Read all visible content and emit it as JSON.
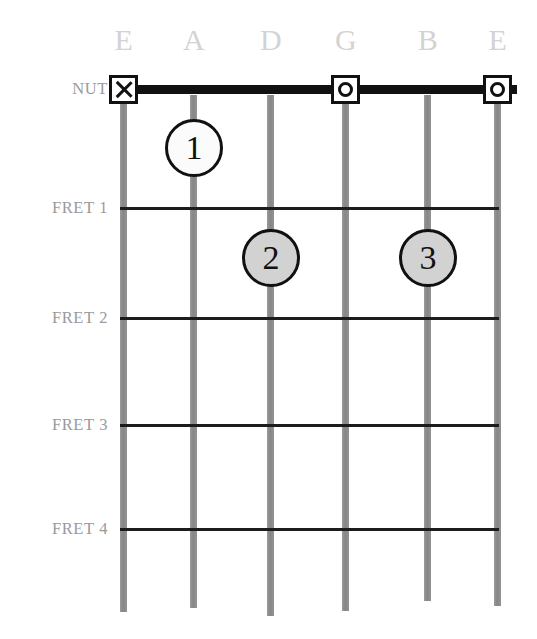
{
  "diagram": {
    "background_color": "#ffffff",
    "string_color": "#8d8d8d",
    "fret_color": "#1c1c1c",
    "nut_color": "#111111",
    "label_color": "#9a9a9a",
    "string_label_color": "#d3d3d3"
  },
  "string_labels": [
    {
      "name": "E",
      "x": 124
    },
    {
      "name": "A",
      "x": 194
    },
    {
      "name": "D",
      "x": 271
    },
    {
      "name": "G",
      "x": 346
    },
    {
      "name": "B",
      "x": 428
    },
    {
      "name": "E",
      "x": 498
    }
  ],
  "row_labels": [
    {
      "text": "NUT",
      "y": 80
    },
    {
      "text": "FRET 1",
      "y": 199
    },
    {
      "text": "FRET 2",
      "y": 309
    },
    {
      "text": "FRET 3",
      "y": 416
    },
    {
      "text": "FRET 4",
      "y": 520
    }
  ],
  "strings": [
    {
      "label": "E",
      "x": 120,
      "top": 89,
      "bottom": 612
    },
    {
      "label": "A",
      "x": 190,
      "top": 95,
      "bottom": 608
    },
    {
      "label": "D",
      "x": 267,
      "top": 95,
      "bottom": 616
    },
    {
      "label": "G",
      "x": 342,
      "top": 89,
      "bottom": 611
    },
    {
      "label": "B",
      "x": 424,
      "top": 95,
      "bottom": 601
    },
    {
      "label": "E",
      "x": 494,
      "top": 89,
      "bottom": 606
    }
  ],
  "nut": {
    "x": 112,
    "y": 85,
    "width": 405
  },
  "fret_lines": [
    {
      "fret": 1,
      "y": 207,
      "x": 120,
      "width": 379
    },
    {
      "fret": 2,
      "y": 317,
      "x": 120,
      "width": 379
    },
    {
      "fret": 3,
      "y": 424,
      "x": 120,
      "width": 379
    },
    {
      "fret": 4,
      "y": 528,
      "x": 120,
      "width": 379
    }
  ],
  "nut_markers": [
    {
      "string": "E",
      "glyph": "x-mark",
      "symbol": "X",
      "x": 109,
      "y": 75
    },
    {
      "string": "G",
      "glyph": "open-circle",
      "symbol": "O",
      "x": 331,
      "y": 75
    },
    {
      "string": "E",
      "glyph": "open-circle",
      "symbol": "O",
      "x": 483,
      "y": 75
    }
  ],
  "finger_dots": [
    {
      "finger": "1",
      "string": "A",
      "fret": 1,
      "fill": "white",
      "x": 165,
      "y": 119
    },
    {
      "finger": "2",
      "string": "D",
      "fret": 2,
      "fill": "gray",
      "x": 242,
      "y": 229
    },
    {
      "finger": "3",
      "string": "B",
      "fret": 2,
      "fill": "gray",
      "x": 399,
      "y": 229
    }
  ]
}
